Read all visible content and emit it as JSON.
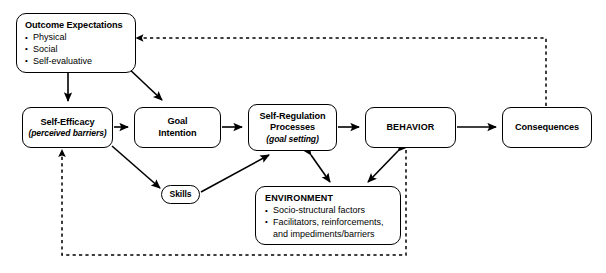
{
  "diagram": {
    "background_color": "#ffffff",
    "line_color": "#000000",
    "nodes": {
      "outcome_expectations": {
        "title": "Outcome Expectations",
        "bullets": [
          "Physical",
          "Social",
          "Self-evaluative"
        ]
      },
      "self_efficacy": {
        "title": "Self-Efficacy",
        "subtitle": "(perceived barriers)"
      },
      "goal_intention": {
        "title_line1": "Goal",
        "title_line2": "Intention"
      },
      "self_regulation": {
        "title_line1": "Self-Regulation",
        "title_line2": "Processes",
        "subtitle": "(goal setting)"
      },
      "behavior": {
        "title": "BEHAVIOR"
      },
      "consequences": {
        "title": "Consequences"
      },
      "skills": {
        "title": "Skills"
      },
      "environment": {
        "title": "ENVIRONMENT",
        "bullets": [
          "Socio-structural factors",
          "Facilitators, reinforcements,",
          "and impediments/barriers"
        ]
      }
    },
    "edges": [
      {
        "id": "outcome-to-self-efficacy",
        "from": "Outcome Expectations",
        "to": "Self-Efficacy",
        "style": "solid",
        "arrows": "single"
      },
      {
        "id": "outcome-to-goal-intention",
        "from": "Outcome Expectations",
        "to": "Goal Intention",
        "style": "solid",
        "arrows": "single"
      },
      {
        "id": "self-efficacy-to-goal-intention",
        "from": "Self-Efficacy",
        "to": "Goal Intention",
        "style": "solid",
        "arrows": "single"
      },
      {
        "id": "goal-intention-to-self-regulation",
        "from": "Goal Intention",
        "to": "Self-Regulation Processes",
        "style": "solid",
        "arrows": "single"
      },
      {
        "id": "self-efficacy-to-skills",
        "from": "Self-Efficacy",
        "to": "Skills",
        "style": "solid",
        "arrows": "single"
      },
      {
        "id": "skills-to-self-regulation",
        "from": "Skills",
        "to": "Self-Regulation Processes",
        "style": "solid",
        "arrows": "single"
      },
      {
        "id": "self-regulation-to-behavior",
        "from": "Self-Regulation Processes",
        "to": "BEHAVIOR",
        "style": "solid",
        "arrows": "single"
      },
      {
        "id": "self-regulation-environment",
        "from": "Self-Regulation Processes",
        "to": "ENVIRONMENT",
        "style": "solid",
        "arrows": "double"
      },
      {
        "id": "behavior-environment",
        "from": "BEHAVIOR",
        "to": "ENVIRONMENT",
        "style": "solid",
        "arrows": "double"
      },
      {
        "id": "behavior-to-consequences",
        "from": "BEHAVIOR",
        "to": "Consequences",
        "style": "solid",
        "arrows": "single"
      },
      {
        "id": "consequences-to-outcome",
        "from": "Consequences",
        "to": "Outcome Expectations",
        "style": "dashed",
        "arrows": "single"
      },
      {
        "id": "behavior-to-self-efficacy",
        "from": "BEHAVIOR",
        "to": "Self-Efficacy",
        "style": "dashed",
        "arrows": "single"
      }
    ]
  }
}
